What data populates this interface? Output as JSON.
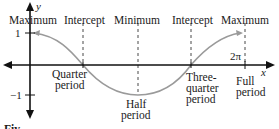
{
  "diagram": {
    "axes": {
      "x_label": "x",
      "y_label": "y",
      "y_ticks": [
        "1",
        "−1"
      ],
      "x_tick_end": "2π"
    },
    "top_labels": [
      "Maximum",
      "Intercept",
      "Minimum",
      "Intercept",
      "Maximum"
    ],
    "bottom_labels": {
      "quarter": [
        "Quarter",
        "period"
      ],
      "half": [
        "Half",
        "period"
      ],
      "three_quarter": [
        "Three-",
        "quarter",
        "period"
      ],
      "full": [
        "Full",
        "period"
      ]
    },
    "caption_fragment": "Fiv",
    "colors": {
      "axis": "#111111",
      "curve": "#9a9a9a",
      "guide": "#333333",
      "text": "#1a1a1a"
    },
    "curve": {
      "function": "cos",
      "key_points": [
        {
          "name": "Maximum",
          "x": "0",
          "y": 1
        },
        {
          "name": "Intercept",
          "x": "Quarter period",
          "y": 0
        },
        {
          "name": "Minimum",
          "x": "Half period",
          "y": -1
        },
        {
          "name": "Intercept",
          "x": "Three-quarter period",
          "y": 0
        },
        {
          "name": "Maximum",
          "x": "Full period (2π)",
          "y": 1
        }
      ]
    }
  }
}
